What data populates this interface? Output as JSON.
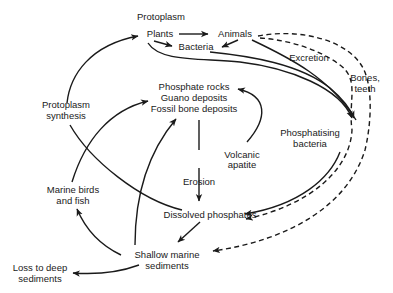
{
  "diagram": {
    "colors": {
      "ink": "#1a1a1a",
      "background": "#ffffff"
    },
    "nodes": {
      "protoplasm": "Protoplasm",
      "plants": "Plants",
      "animals": "Animals",
      "bacteria": "Bacteria",
      "excretion": "Excretion",
      "bones_teeth_1": "Bones,",
      "bones_teeth_2": "teeth",
      "phosphate_rocks": "Phosphate rocks",
      "guano_deposits": "Guano deposits",
      "fossil_bone_deposits": "Fossil bone deposits",
      "protoplasm_synthesis_1": "Protoplasm",
      "protoplasm_synthesis_2": "synthesis",
      "phosphatising_bacteria_1": "Phosphatising",
      "phosphatising_bacteria_2": "bacteria",
      "volcanic_apatite_1": "Volcanic",
      "volcanic_apatite_2": "apatite",
      "erosion": "Erosion",
      "marine_birds_1": "Marine birds",
      "marine_birds_2": "and fish",
      "dissolved_phosphates": "Dissolved phosphates",
      "shallow_marine_1": "Shallow marine",
      "shallow_marine_2": "sediments",
      "loss_deep_1": "Loss to deep",
      "loss_deep_2": "sediments"
    },
    "edges": [
      {
        "from": "Plants",
        "to": "Animals",
        "style": "solid"
      },
      {
        "from": "Plants",
        "to": "Bacteria",
        "style": "solid"
      },
      {
        "from": "Animals",
        "to": "Bacteria",
        "style": "solid"
      },
      {
        "from": "Plants",
        "to": "Phosphatising bacteria",
        "style": "solid"
      },
      {
        "from": "Bacteria",
        "to": "Phosphatising bacteria",
        "style": "solid"
      },
      {
        "from": "Animals",
        "to": "Phosphatising bacteria",
        "style": "solid"
      },
      {
        "from": "Animals",
        "to": "Dissolved phosphates",
        "label": "Excretion",
        "style": "dashed"
      },
      {
        "from": "Animals",
        "to": "Shallow marine sediments",
        "label": "Bones, teeth",
        "style": "dashed"
      },
      {
        "from": "Phosphatising bacteria",
        "to": "Dissolved phosphates",
        "style": "solid"
      },
      {
        "from": "Fossil bone deposits",
        "to": "Dissolved phosphates",
        "label": "Erosion",
        "style": "solid"
      },
      {
        "from": "Volcanic apatite",
        "to": "Phosphate rocks",
        "style": "solid"
      },
      {
        "from": "Dissolved phosphates",
        "to": "Plants",
        "label": "Protoplasm synthesis",
        "style": "solid"
      },
      {
        "from": "Dissolved phosphates",
        "to": "Shallow marine sediments",
        "style": "solid"
      },
      {
        "from": "Shallow marine sediments",
        "to": "Marine birds and fish",
        "style": "solid"
      },
      {
        "from": "Marine birds and fish",
        "to": "Phosphate rocks",
        "style": "solid"
      },
      {
        "from": "Shallow marine sediments",
        "to": "Fossil bone deposits",
        "style": "solid"
      },
      {
        "from": "Shallow marine sediments",
        "to": "Loss to deep sediments",
        "style": "solid"
      }
    ]
  }
}
